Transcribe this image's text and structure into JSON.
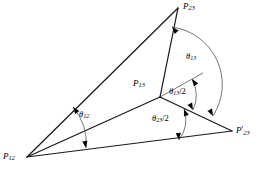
{
  "figure": {
    "type": "geometry-diagram",
    "background_color": "#ffffff",
    "line_color": "#1a1a1a",
    "arc_color": "#555555"
  },
  "vertices": [
    {
      "id": "P23",
      "base": "P",
      "sub": "23",
      "prime": "",
      "label": "P23",
      "x": 178,
      "y": 8,
      "label_x": 183,
      "label_y": 2,
      "name": "vertex-p23-top"
    },
    {
      "id": "P13",
      "base": "P",
      "sub": "13",
      "prime": "",
      "label": "P13",
      "x": 160,
      "y": 97,
      "label_x": 133,
      "label_y": 79,
      "name": "vertex-p13-center"
    },
    {
      "id": "P12",
      "base": "P",
      "sub": "12",
      "prime": "",
      "label": "P12",
      "x": 27,
      "y": 157,
      "label_x": 3,
      "label_y": 152,
      "name": "vertex-p12-bottom-left"
    },
    {
      "id": "P23prime",
      "base": "P",
      "sub": "23",
      "prime": "'",
      "label": "P'23",
      "x": 232,
      "y": 131,
      "label_x": 236,
      "label_y": 125,
      "name": "vertex-p23-prime-right"
    }
  ],
  "edges": [
    {
      "id": "e-p12-p23",
      "from": "P12",
      "to": "P23",
      "width": 1.25,
      "name": "edge-p12-p23"
    },
    {
      "id": "e-p23-p13",
      "from": "P23",
      "to": "P13",
      "width": 1.25,
      "name": "edge-p23-p13"
    },
    {
      "id": "e-p12-p13",
      "from": "P12",
      "to": "P13",
      "width": 1.25,
      "name": "edge-p12-p13"
    },
    {
      "id": "e-p13-p23prime",
      "from": "P13",
      "to": "P23prime",
      "width": 1.25,
      "name": "edge-p13-p23prime"
    },
    {
      "id": "e-p12-p23prime",
      "from": "P12",
      "to": "P23prime",
      "width": 1.25,
      "name": "edge-p12-p23prime-baseline"
    }
  ],
  "bisector_ray": {
    "from": "P13",
    "x1": 160,
    "y1": 97,
    "x2": 203,
    "y2": 73,
    "width": 0.6,
    "name": "bisector-ray-p13"
  },
  "angles": [
    {
      "id": "theta13",
      "base": "θ",
      "sub": "13",
      "suffix": "",
      "label": "θ13",
      "label_x": 186,
      "label_y": 52,
      "vertex": "P13",
      "arc": "M 172 27 A 58 58 0 0 1 213 116",
      "arrow_start": {
        "x": 172,
        "y": 27,
        "angle": 228
      },
      "arrow_end": {
        "x": 213,
        "y": 116,
        "angle": 62
      },
      "name": "angle-theta13"
    },
    {
      "id": "theta13half",
      "base": "θ",
      "sub": "13",
      "suffix": "/2",
      "label": "θ13/2",
      "label_x": 169,
      "label_y": 87,
      "vertex": "P13",
      "arc": "M 192 79 A 35 35 0 0 1 193 110",
      "arrow_start": {
        "x": 192,
        "y": 79,
        "angle": 235
      },
      "arrow_end": {
        "x": 193,
        "y": 110,
        "angle": 63
      },
      "name": "angle-theta13-half"
    },
    {
      "id": "theta23half",
      "base": "θ",
      "sub": "23",
      "suffix": "/2",
      "label": "θ23/2",
      "label_x": 152,
      "label_y": 114,
      "vertex": "P23prime",
      "arc": "M 184 109 A 34 34 0 0 1 179 140",
      "arrow_start": {
        "x": 184,
        "y": 109,
        "angle": 250
      },
      "arrow_end": {
        "x": 179,
        "y": 140,
        "angle": 84
      },
      "name": "angle-theta23-half"
    },
    {
      "id": "theta12",
      "base": "θ",
      "sub": "12",
      "suffix": "",
      "label": "θ12",
      "label_x": 79,
      "label_y": 110,
      "vertex": "P12",
      "arc": "M 73 107 A 56 56 0 0 1 86 148",
      "arrow_start": {
        "x": 73,
        "y": 107,
        "angle": 232
      },
      "arrow_end": {
        "x": 86,
        "y": 148,
        "angle": 80
      },
      "name": "angle-theta12"
    }
  ]
}
